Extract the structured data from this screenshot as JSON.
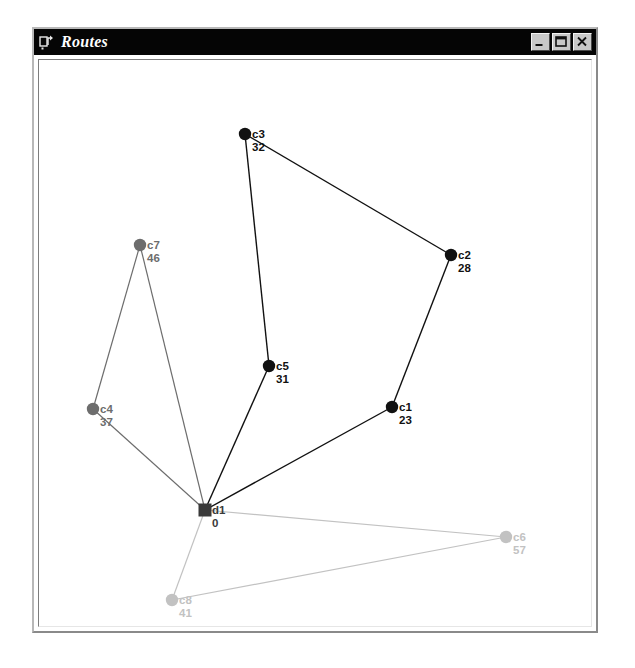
{
  "window": {
    "title": "Routes",
    "icon": "app-window-icon",
    "buttons": [
      {
        "name": "minimize-button",
        "glyph": "minimize-icon",
        "label": "_"
      },
      {
        "name": "maximize-button",
        "glyph": "maximize-icon",
        "label": "□"
      },
      {
        "name": "close-button",
        "glyph": "close-icon",
        "label": "×"
      }
    ]
  },
  "canvas": {
    "width": 554,
    "height": 568,
    "background": "#ffffff"
  },
  "colors": {
    "route_1": "#111111",
    "route_2": "#6d6d6d",
    "route_3": "#c2c2c2",
    "depot": "#3a3a3a",
    "background": "#ffffff",
    "titlebar": "#050505",
    "title_text": "#ffffff"
  },
  "chart_data": {
    "type": "scatter",
    "title": "Routes",
    "xlabel": "",
    "ylabel": "",
    "nodes": [
      {
        "id": "d1",
        "label": "d1",
        "value": "0",
        "kind": "depot",
        "marker": "square",
        "color": "#3a3a3a",
        "x": 166,
        "y": 450
      },
      {
        "id": "c1",
        "label": "c1",
        "value": "23",
        "kind": "customer",
        "marker": "circle",
        "color": "#111111",
        "x": 353,
        "y": 347
      },
      {
        "id": "c2",
        "label": "c2",
        "value": "28",
        "kind": "customer",
        "marker": "circle",
        "color": "#111111",
        "x": 412,
        "y": 195
      },
      {
        "id": "c3",
        "label": "c3",
        "value": "32",
        "kind": "customer",
        "marker": "circle",
        "color": "#111111",
        "x": 206,
        "y": 74
      },
      {
        "id": "c5",
        "label": "c5",
        "value": "31",
        "kind": "customer",
        "marker": "circle",
        "color": "#111111",
        "x": 230,
        "y": 306
      },
      {
        "id": "c4",
        "label": "c4",
        "value": "37",
        "kind": "customer",
        "marker": "circle",
        "color": "#6d6d6d",
        "x": 54,
        "y": 349
      },
      {
        "id": "c7",
        "label": "c7",
        "value": "46",
        "kind": "customer",
        "marker": "circle",
        "color": "#6d6d6d",
        "x": 101,
        "y": 185
      },
      {
        "id": "c6",
        "label": "c6",
        "value": "57",
        "kind": "customer",
        "marker": "circle",
        "color": "#c2c2c2",
        "x": 467,
        "y": 477
      },
      {
        "id": "c8",
        "label": "c8",
        "value": "41",
        "kind": "customer",
        "marker": "circle",
        "color": "#c2c2c2",
        "x": 133,
        "y": 540
      }
    ],
    "routes": [
      {
        "name": "route-1",
        "color": "#111111",
        "width": 1.4,
        "sequence": [
          "d1",
          "c5",
          "c3",
          "c2",
          "c1",
          "d1"
        ]
      },
      {
        "name": "route-2",
        "color": "#6d6d6d",
        "width": 1.2,
        "sequence": [
          "d1",
          "c7",
          "c4",
          "d1"
        ]
      },
      {
        "name": "route-3",
        "color": "#c2c2c2",
        "width": 1.2,
        "sequence": [
          "d1",
          "c6",
          "c8",
          "d1"
        ]
      }
    ]
  }
}
